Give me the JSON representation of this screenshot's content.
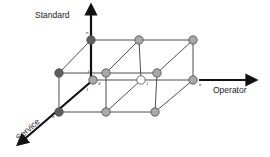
{
  "diagram": {
    "axes": {
      "standard": {
        "label": "Standard",
        "direction": "up"
      },
      "operator": {
        "label": "Operator",
        "direction": "right"
      },
      "service": {
        "label": "Service",
        "direction": "down-left"
      }
    },
    "tick_labels": {
      "standard_n": "n",
      "standard_1": "1",
      "origin_0": "0",
      "service_1": "1",
      "service_n": "n",
      "operator_1": "1",
      "operator_n": "n"
    },
    "colors": {
      "dark_node": "#5e5e5e",
      "grey_node": "#a8a8a8",
      "white_node": "#ffffff",
      "edge": "#3a3a3a",
      "axis": "#111111"
    },
    "nodes": [
      {
        "id": "s1-o0-v0",
        "shade": "grey"
      },
      {
        "id": "s0-o1-v0",
        "shade": "white"
      },
      {
        "id": "s0-on-v0",
        "shade": "grey"
      },
      {
        "id": "sn-o0-v0",
        "shade": "dark"
      },
      {
        "id": "sn-o1-v0",
        "shade": "grey"
      },
      {
        "id": "sn-on-v0",
        "shade": "grey"
      },
      {
        "id": "sn-o0-vn",
        "shade": "dark"
      },
      {
        "id": "sn-o1-vn",
        "shade": "grey"
      },
      {
        "id": "sn-on-vn",
        "shade": "grey"
      },
      {
        "id": "s0-o0-vn",
        "shade": "dark"
      },
      {
        "id": "s0-o1-vn",
        "shade": "grey"
      },
      {
        "id": "s0-on-vn",
        "shade": "grey"
      }
    ]
  }
}
